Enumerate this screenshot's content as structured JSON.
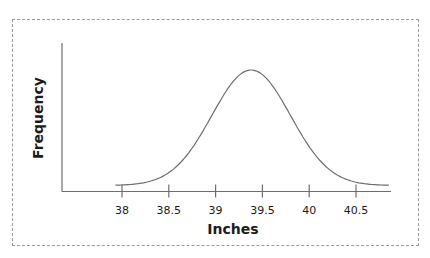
{
  "chart_data": {
    "type": "line",
    "title": "",
    "xlabel": "Inches",
    "ylabel": "Frequency",
    "x_ticks": [
      38,
      38.5,
      39,
      39.5,
      40,
      40.5
    ],
    "x_tick_labels": [
      "38",
      "38.5",
      "39",
      "39.5",
      "40",
      "40.5"
    ],
    "xlim": [
      37.8,
      40.85
    ],
    "y_ticks": [],
    "grid": false,
    "legend": null,
    "series": [
      {
        "name": "Normal distribution",
        "distribution": "normal",
        "mean": 39.38,
        "std": 0.42,
        "x_range": [
          37.93,
          40.85
        ]
      }
    ]
  },
  "axes": {
    "x_label": "Inches",
    "y_label": "Frequency"
  },
  "colors": {
    "axis": "#6e6e6e",
    "curve": "#6e6e6e",
    "frame": "#9a9a9a",
    "text": "#1a1a1a"
  }
}
